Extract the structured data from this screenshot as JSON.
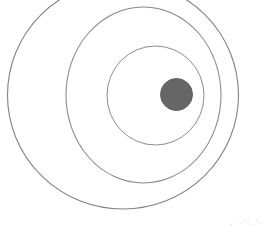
{
  "figure": {
    "title": "Concentric circles diagram",
    "background_color": "#ffffff",
    "canvas": {
      "width": 264,
      "height": 234
    },
    "stroke_color": "#808080",
    "stroke_width": 1.1,
    "dot_color": "#666666"
  },
  "chart_data": {
    "type": "scatter",
    "title": "Concentric circles diagram",
    "xlabel": "",
    "ylabel": "",
    "xlim": [
      0,
      264
    ],
    "ylim": [
      0,
      234
    ],
    "grid": false,
    "legend": "none",
    "shapes": [
      {
        "name": "outer-ring",
        "kind": "ellipse",
        "cx": 123,
        "cy": 95,
        "rx": 115.5,
        "ry": 114,
        "fill": "none",
        "stroke": "#828282",
        "stroke_width": 1.1,
        "clipped_top": true
      },
      {
        "name": "middle-ring",
        "kind": "ellipse",
        "cx": 143.5,
        "cy": 95,
        "rx": 77.5,
        "ry": 88,
        "fill": "none",
        "stroke": "#878787",
        "stroke_width": 1.05
      },
      {
        "name": "inner-ring",
        "kind": "ellipse",
        "cx": 155.5,
        "cy": 95.5,
        "rx": 48.5,
        "ry": 49.5,
        "fill": "none",
        "stroke": "#8c8c8c",
        "stroke_width": 1
      },
      {
        "name": "center-dot",
        "kind": "circle",
        "cx": 176.5,
        "cy": 94.5,
        "r": 16,
        "fill": "#666666",
        "stroke": "#5e5e5e",
        "stroke_width": 1
      }
    ],
    "annotations": []
  }
}
